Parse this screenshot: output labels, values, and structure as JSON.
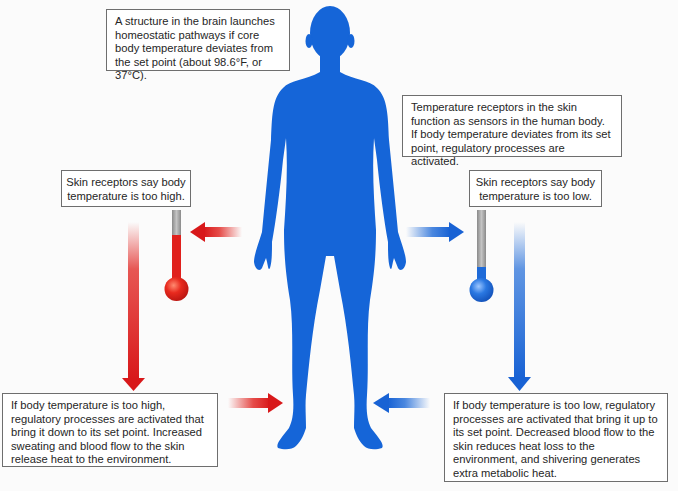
{
  "diagram": {
    "colors": {
      "body": "#1565d8",
      "hot": "#e0201c",
      "cold": "#1e6ad8",
      "border": "#6e6e6e",
      "thermometer_tube": "#9a9a9a"
    },
    "boxes": {
      "brain": "A structure in the brain launches homeostatic pathways if core body temperature deviates from the set point (about 98.6°F, or 37°C).",
      "sensors": "Temperature receptors in the skin function as sensors in the human body. If body temperature deviates from its set point, regulatory processes are activated.",
      "high_receptor": "Skin receptors say body temperature is too high.",
      "low_receptor": "Skin receptors say body temperature is too low.",
      "high_response": "If body temperature is too high, regulatory processes are activated that bring it down to its set point. Increased sweating and blood flow to the skin release heat to the environment.",
      "low_response": "If body temperature is too low, regulatory processes are activated that bring it up to its set point. Decreased blood flow to the skin reduces heat loss to the environment, and shivering generates extra metabolic heat."
    },
    "icons": {
      "body": "human-body-silhouette",
      "hot_thermometer": "thermometer-high",
      "cold_thermometer": "thermometer-low"
    }
  }
}
